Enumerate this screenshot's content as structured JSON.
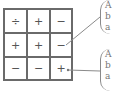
{
  "grid": {
    "rows": [
      [
        "÷",
        "+",
        "−"
      ],
      [
        "+",
        "+",
        "−"
      ],
      [
        "−",
        "−",
        "+"
      ]
    ]
  },
  "callouts": [
    {
      "lines": [
        "A",
        "b",
        "a"
      ]
    },
    {
      "lines": [
        "A",
        "b",
        "a"
      ]
    }
  ],
  "colors": {
    "grid_line": "#6a6a6a",
    "text": "#555555",
    "leader": "#8a8a8a"
  }
}
